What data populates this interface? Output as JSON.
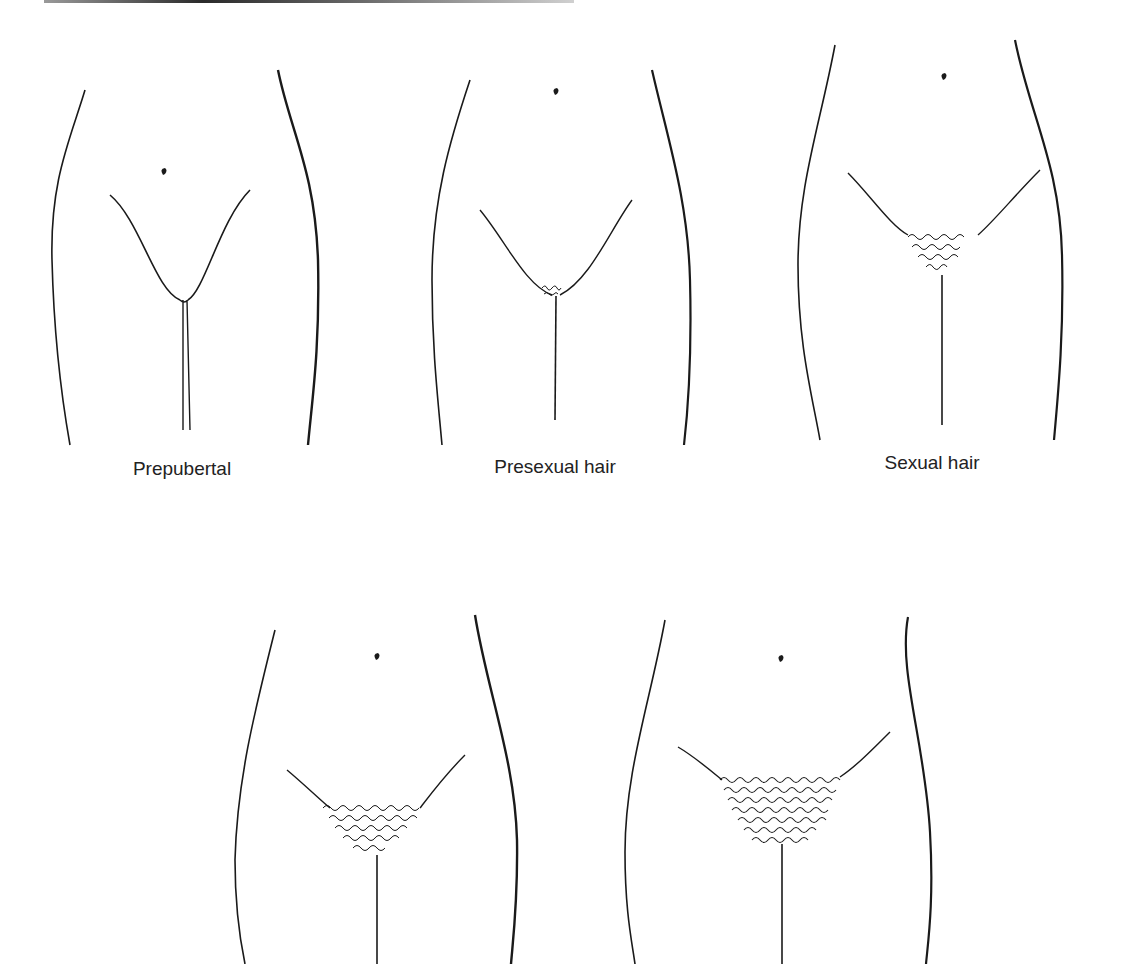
{
  "diagram": {
    "type": "anatomical stage illustration",
    "stages": [
      {
        "id": "stage-1",
        "label": "Prepubertal",
        "hair_density": 0
      },
      {
        "id": "stage-2",
        "label": "Presexual hair",
        "hair_density": 1
      },
      {
        "id": "stage-3",
        "label": "Sexual hair",
        "hair_density": 2
      },
      {
        "id": "stage-4",
        "label": "",
        "hair_density": 3
      },
      {
        "id": "stage-5",
        "label": "",
        "hair_density": 4
      }
    ],
    "line_color": "#1a1a1a",
    "background": "#ffffff"
  }
}
